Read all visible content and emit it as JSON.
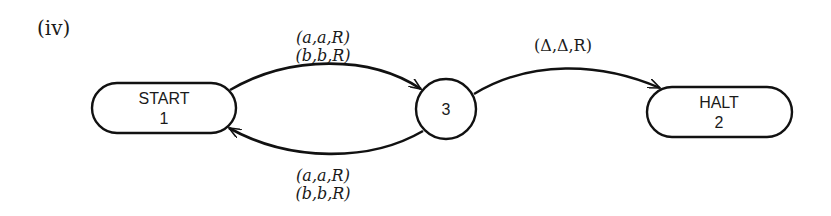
{
  "figure": {
    "label": "(iv)"
  },
  "nodes": [
    {
      "id": "start",
      "shape": "rounded",
      "line1": "START",
      "line2": "1"
    },
    {
      "id": "state3",
      "shape": "circle",
      "line1": "3"
    },
    {
      "id": "halt",
      "shape": "rounded",
      "line1": "HALT",
      "line2": "2"
    }
  ],
  "edges": [
    {
      "from": "START 1",
      "to": "3",
      "labels": [
        "(a,a,R)",
        "(b,b,R)"
      ],
      "position": "top"
    },
    {
      "from": "3",
      "to": "START 1",
      "labels": [
        "(a,a,R)",
        "(b,b,R)"
      ],
      "position": "bottom"
    },
    {
      "from": "3",
      "to": "HALT 2",
      "labels": [
        "(Δ,Δ,R)"
      ],
      "position": "top"
    }
  ],
  "colors": {
    "stroke": "#111111",
    "background": "#ffffff"
  }
}
